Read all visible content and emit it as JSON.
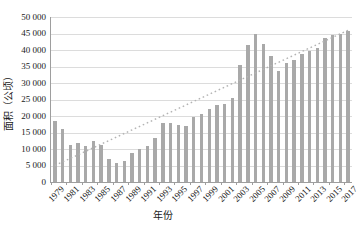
{
  "chart_data": {
    "type": "bar",
    "title": "",
    "xlabel": "年份",
    "ylabel": "面积（公顷）",
    "categories": [
      "1979",
      "1980",
      "1981",
      "1982",
      "1983",
      "1984",
      "1985",
      "1986",
      "1987",
      "1988",
      "1989",
      "1990",
      "1991",
      "1992",
      "1993",
      "1994",
      "1995",
      "1996",
      "1997",
      "1998",
      "1999",
      "2000",
      "2001",
      "2002",
      "2003",
      "2004",
      "2005",
      "2006",
      "2007",
      "2008",
      "2009",
      "2010",
      "2011",
      "2012",
      "2013",
      "2014",
      "2015",
      "2016",
      "2017"
    ],
    "values": [
      18500,
      16100,
      11200,
      11900,
      10900,
      12500,
      11200,
      7100,
      5900,
      6500,
      8900,
      10000,
      10900,
      13300,
      17900,
      17900,
      17200,
      17000,
      19800,
      20500,
      22000,
      23400,
      23700,
      25600,
      35500,
      41500,
      44800,
      41800,
      38200,
      33600,
      36100,
      37000,
      38700,
      39700,
      40600,
      43500,
      44500,
      45000,
      45800
    ],
    "x_tick_labels": [
      "1979",
      "1981",
      "1983",
      "1985",
      "1987",
      "1989",
      "1991",
      "1993",
      "1995",
      "1997",
      "1999",
      "2001",
      "2003",
      "2005",
      "2007",
      "2009",
      "2011",
      "2013",
      "2015",
      "2017"
    ],
    "y_tick_values": [
      0,
      5000,
      10000,
      15000,
      20000,
      25000,
      30000,
      35000,
      40000,
      45000,
      50000
    ],
    "y_tick_labels": [
      "0",
      "5 000",
      "10 000",
      "15 000",
      "20 000",
      "25 000",
      "30 000",
      "35 000",
      "40 000",
      "45 000",
      "50 000"
    ],
    "ylim": [
      0,
      50000
    ],
    "grid": true,
    "legend": "none",
    "trendline": {
      "type": "linear",
      "style": "dotted",
      "start_value": 5000,
      "end_value": 46000
    },
    "colors": {
      "bar": "#a9a9a9",
      "gridline": "#dcdcdc",
      "axis": "#9e9e9e",
      "trendline": "#b3b3b3",
      "text": "#1a1a1a",
      "background": "#ffffff"
    }
  }
}
